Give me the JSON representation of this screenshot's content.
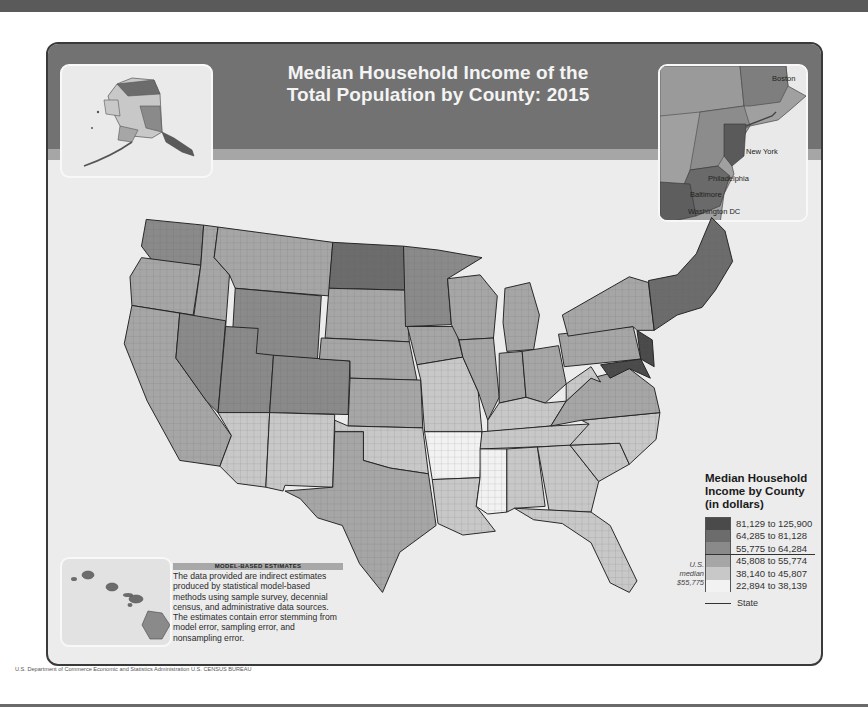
{
  "title": {
    "line1": "Median Household Income of the",
    "line2": "Total Population by County: 2015"
  },
  "insets": {
    "alaska": {
      "label": "Alaska"
    },
    "hawaii": {
      "label": "Hawaii"
    },
    "northeast": {
      "cities": [
        {
          "name": "Boston",
          "x": 127,
          "y": 12
        },
        {
          "name": "New York",
          "x": 90,
          "y": 76
        },
        {
          "name": "Philadelphia",
          "x": 68,
          "y": 103
        },
        {
          "name": "Baltimore",
          "x": 50,
          "y": 118
        },
        {
          "name": "Washington DC",
          "x": 40,
          "y": 138
        }
      ]
    }
  },
  "legend": {
    "title_line1": "Median Household",
    "title_line2": "Income by County",
    "title_line3": "(in dollars)",
    "classes": [
      {
        "lo": "81,129 to",
        "hi": "125,900",
        "color": "#4a4a4a"
      },
      {
        "lo": "64,285 to",
        "hi": "81,128",
        "color": "#6c6c6c"
      },
      {
        "lo": "55,775 to",
        "hi": "64,284",
        "color": "#8a8a8a"
      },
      {
        "lo": "45,808 to",
        "hi": "55,774",
        "color": "#a6a6a6"
      },
      {
        "lo": "38,140 to",
        "hi": "45,807",
        "color": "#c8c8c8"
      },
      {
        "lo": "22,894 to",
        "hi": "38,139",
        "color": "#f2f2f2"
      }
    ],
    "median_note_line1": "U.S.",
    "median_note_line2": "median",
    "median_note_line3": "$55,775",
    "state_boundary_label": "State"
  },
  "note": {
    "heading": "MODEL-BASED ESTIMATES",
    "body": "The data provided are indirect estimates produced by statistical model-based methods using sample survey, decennial census, and administrative data sources. The estimates contain error stemming from model error, sampling error, and nonsampling error."
  },
  "credit": "U.S. Department of Commerce  Economic and Statistics Administration  U.S. CENSUS BUREAU",
  "chart_data": {
    "type": "choropleth",
    "title": "Median Household Income of the Total Population by County: 2015",
    "unit": "dollars",
    "us_median": 55775,
    "classes": [
      {
        "min": 81129,
        "max": 125900
      },
      {
        "min": 64285,
        "max": 81128
      },
      {
        "min": 55775,
        "max": 64284
      },
      {
        "min": 45808,
        "max": 55774
      },
      {
        "min": 38140,
        "max": 45807
      },
      {
        "min": 22894,
        "max": 38139
      }
    ],
    "insets": [
      "Alaska",
      "Hawaii",
      "Northeast corridor (Boston to Washington DC)"
    ]
  },
  "regions": [
    {
      "name": "Washington",
      "cls": 2,
      "pts": "35,60 95,66 92,108 42,104 30,88"
    },
    {
      "name": "Oregon",
      "cls": 3,
      "pts": "30,100 92,108 84,160 20,150 18,120"
    },
    {
      "name": "California",
      "cls": 3,
      "pts": "20,150 70,158 66,205 124,286 112,318 70,312 36,250 12,190"
    },
    {
      "name": "Idaho",
      "cls": 3,
      "pts": "95,66 110,68 106,100 122,118 118,172 84,166 92,108"
    },
    {
      "name": "Nevada",
      "cls": 2,
      "pts": "70,158 118,166 110,262 98,250 66,205"
    },
    {
      "name": "Montana",
      "cls": 3,
      "pts": "110,68 230,84 226,140 128,132 122,118 106,100"
    },
    {
      "name": "Wyoming",
      "cls": 2,
      "pts": "128,132 218,140 214,206 124,200"
    },
    {
      "name": "Utah",
      "cls": 2,
      "pts": "118,172 152,174 150,200 168,202 164,262 110,262"
    },
    {
      "name": "Arizona",
      "cls": 4,
      "pts": "110,262 164,262 160,340 130,336 112,318 124,286"
    },
    {
      "name": "Colorado",
      "cls": 2,
      "pts": "168,202 248,208 246,264 164,262"
    },
    {
      "name": "New Mexico",
      "cls": 4,
      "pts": "164,262 232,264 230,340 180,338 178,344 160,340"
    },
    {
      "name": "North Dakota",
      "cls": 1,
      "pts": "230,84 304,88 306,134 226,132"
    },
    {
      "name": "South Dakota",
      "cls": 3,
      "pts": "226,132 306,134 310,188 222,184"
    },
    {
      "name": "Nebraska",
      "cls": 3,
      "pts": "218,184 310,188 318,228 248,226 248,208 216,206"
    },
    {
      "name": "Kansas",
      "cls": 3,
      "pts": "248,226 322,228 324,278 246,276"
    },
    {
      "name": "Oklahoma",
      "cls": 4,
      "pts": "232,270 246,276 324,278 330,326 290,320 262,312 262,282 232,282"
    },
    {
      "name": "Texas",
      "cls": 3,
      "pts": "232,282 262,282 262,312 290,320 330,326 338,380 300,408 282,450 258,420 240,380 214,372 196,352 180,344 230,340"
    },
    {
      "name": "Minnesota",
      "cls": 2,
      "pts": "304,88 340,92 386,100 350,122 354,170 306,172"
    },
    {
      "name": "Iowa",
      "cls": 3,
      "pts": "308,172 358,172 366,204 318,212"
    },
    {
      "name": "Missouri",
      "cls": 4,
      "pts": "318,212 366,204 382,240 386,282 326,282 322,228"
    },
    {
      "name": "Arkansas",
      "cls": 5,
      "pts": "326,282 386,282 384,330 334,332"
    },
    {
      "name": "Louisiana",
      "cls": 4,
      "pts": "334,332 384,330 380,360 400,386 366,390 340,378"
    },
    {
      "name": "Wisconsin",
      "cls": 3,
      "pts": "350,122 384,118 402,140 398,184 362,186 354,170"
    },
    {
      "name": "Illinois",
      "cls": 3,
      "pts": "362,186 398,184 404,246 392,270 382,240 366,204"
    },
    {
      "name": "Michigan",
      "cls": 3,
      "pts": "410,132 436,126 446,160 440,196 412,198 408,168"
    },
    {
      "name": "Indiana",
      "cls": 3,
      "pts": "404,200 428,198 432,246 404,252"
    },
    {
      "name": "Ohio",
      "cls": 3,
      "pts": "428,198 466,192 474,232 452,252 432,246"
    },
    {
      "name": "Kentucky",
      "cls": 4,
      "pts": "392,270 404,252 432,246 452,252 474,250 458,276 392,282"
    },
    {
      "name": "Tennessee",
      "cls": 4,
      "pts": "386,282 458,276 498,274 490,296 384,300"
    },
    {
      "name": "Mississippi",
      "cls": 5,
      "pts": "384,300 412,300 412,366 392,368 380,360 384,330"
    },
    {
      "name": "Alabama",
      "cls": 4,
      "pts": "412,300 444,298 452,360 420,362 412,366"
    },
    {
      "name": "Georgia",
      "cls": 4,
      "pts": "444,298 478,296 508,334 500,366 456,364"
    },
    {
      "name": "Florida",
      "cls": 4,
      "pts": "420,362 500,366 520,380 548,438 540,450 520,440 500,398 470,378 440,374"
    },
    {
      "name": "South Carolina",
      "cls": 4,
      "pts": "478,296 530,294 540,316 508,334"
    },
    {
      "name": "North Carolina",
      "cls": 4,
      "pts": "490,270 572,262 568,290 540,316 530,294 478,296 498,274"
    },
    {
      "name": "Virginia",
      "cls": 3,
      "pts": "474,250 500,226 540,216 566,236 572,262 490,270 458,276"
    },
    {
      "name": "West Virginia",
      "cls": 4,
      "pts": "474,232 500,214 510,230 500,226 474,250"
    },
    {
      "name": "Pennsylvania",
      "cls": 3,
      "pts": "466,180 544,172 552,206 472,214"
    },
    {
      "name": "Maryland-DE",
      "cls": 0,
      "pts": "510,212 552,206 562,226 540,216 520,226"
    },
    {
      "name": "New Jersey",
      "cls": 0,
      "pts": "548,176 564,186 566,214 552,206"
    },
    {
      "name": "New York",
      "cls": 3,
      "pts": "470,160 540,120 560,126 566,176 548,176 544,172 476,182"
    },
    {
      "name": "New England",
      "cls": 1,
      "pts": "560,124 590,118 610,96 626,58 640,72 648,104 630,134 616,152 590,160 566,176"
    }
  ]
}
